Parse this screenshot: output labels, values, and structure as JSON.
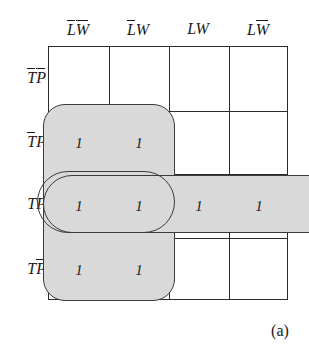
{
  "figure": {
    "kind": "karnaugh-map",
    "caption": "(a)",
    "variables": [
      "T",
      "P",
      "L",
      "W"
    ]
  },
  "columns": [
    {
      "id": "c0",
      "text": "LW",
      "bars": [
        "L",
        "W"
      ],
      "label": "L̄W̄"
    },
    {
      "id": "c1",
      "text": "LW",
      "bars": [
        "L"
      ],
      "label": "L̄W"
    },
    {
      "id": "c2",
      "text": "LW",
      "bars": [],
      "label": "LW"
    },
    {
      "id": "c3",
      "text": "LW",
      "bars": [
        "W"
      ],
      "label": "LW̄"
    }
  ],
  "rows": [
    {
      "id": "r0",
      "text": "TP",
      "bars": [
        "T",
        "P"
      ],
      "label": "T̄P̄"
    },
    {
      "id": "r1",
      "text": "TP",
      "bars": [
        "T"
      ],
      "label": "T̄P"
    },
    {
      "id": "r2",
      "text": "TP",
      "bars": [],
      "label": "TP"
    },
    {
      "id": "r3",
      "text": "TP",
      "bars": [
        "P"
      ],
      "label": "TP̄"
    }
  ],
  "cells": {
    "r0": [
      "",
      "",
      "",
      ""
    ],
    "r1": [
      "1",
      "1",
      "",
      ""
    ],
    "r2": [
      "1",
      "1",
      "1",
      "1"
    ],
    "r3": [
      "1",
      "1",
      "",
      ""
    ]
  },
  "cell_values": {
    "r1c0": "1",
    "r1c1": "1",
    "r2c0": "1",
    "r2c1": "1",
    "r2c2": "1",
    "r2c3": "1",
    "r3c0": "1",
    "r3c1": "1"
  },
  "groups": [
    {
      "id": "group-vertical",
      "name": "vertical-group",
      "covers_rows": [
        "r1",
        "r2",
        "r3"
      ],
      "covers_cols": [
        "c0",
        "c1"
      ],
      "style": "shaded",
      "fill": "#d9d9d9",
      "stroke": "#3a3a3a"
    },
    {
      "id": "group-row-wide",
      "name": "horizontal-group",
      "covers_rows": [
        "r2"
      ],
      "covers_cols": [
        "c0",
        "c1",
        "c2",
        "c3"
      ],
      "style": "shaded",
      "fill": "#d9d9d9",
      "stroke": "#3a3a3a"
    },
    {
      "id": "group-row-pair",
      "name": "pair-group-outline",
      "covers_rows": [
        "r2"
      ],
      "covers_cols": [
        "c0",
        "c1"
      ],
      "style": "outline",
      "fill": "none",
      "stroke": "#3a3a3a"
    }
  ],
  "colors": {
    "grid_line": "#2b2b2b",
    "group_fill": "#d9d9d9",
    "group_stroke": "#3a3a3a",
    "text": "#1a1a1a",
    "background": "#ffffff"
  }
}
